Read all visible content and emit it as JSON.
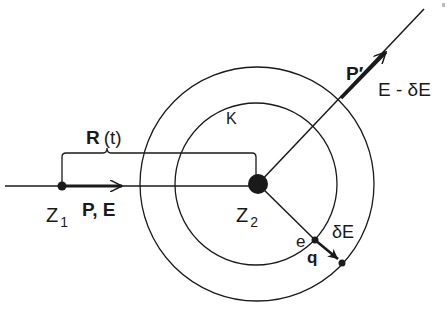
{
  "diagram": {
    "labels": {
      "projectile": "Z",
      "projectile_sub": "1",
      "target": "Z",
      "target_sub": "2",
      "incoming_momentum": "P, E",
      "distance": "R",
      "distance_arg": "(t)",
      "shell": "K",
      "outgoing_momentum": "P′",
      "outgoing_energy": "E - δE",
      "electron": "e",
      "transfer_momentum": "q",
      "transfer_energy": "δE"
    },
    "colors": {
      "stroke": "#1a1a1a",
      "background": "#ffffff"
    }
  }
}
